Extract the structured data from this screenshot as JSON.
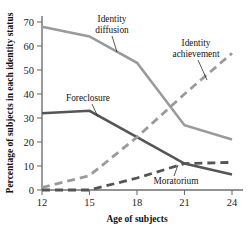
{
  "chart_data": {
    "type": "line",
    "title": "",
    "xlabel": "Age of subjects",
    "ylabel": "Percentage of subjects in each identity status",
    "x": [
      12,
      15,
      18,
      21,
      24
    ],
    "xlim": [
      12,
      24
    ],
    "ylim": [
      0,
      70
    ],
    "xticks": [
      "12",
      "15",
      "18",
      "21",
      "24"
    ],
    "yticks": [
      "0",
      "10",
      "20",
      "30",
      "40",
      "50",
      "60",
      "70"
    ],
    "grid": false,
    "legend_position": "inline-annotations",
    "series": [
      {
        "name": "Identity diffusion",
        "values": [
          68,
          64,
          53,
          27,
          21
        ],
        "color": "#9a9a9a",
        "style": "solid",
        "width": 2.6,
        "label_x": 112,
        "label_y": 22,
        "label_line2_y": 33,
        "label_anchor": "middle",
        "leader": "M112,36 L117,52"
      },
      {
        "name": "Foreclosure",
        "values": [
          32,
          33,
          22,
          11,
          6.5
        ],
        "color": "#555555",
        "style": "solid",
        "width": 2.6,
        "label_x": 88,
        "label_y": 101,
        "label_line2_y": 0,
        "label_anchor": "middle",
        "leader": "M92,104 L98,117"
      },
      {
        "name": "Identity achievement",
        "values": [
          1,
          6,
          22,
          40,
          57
        ],
        "color": "#9a9a9a",
        "style": "dashed",
        "width": 2.8,
        "label_x": 196,
        "label_y": 46,
        "label_line2_y": 57,
        "label_anchor": "middle",
        "leader": "M198,60 L207,80"
      },
      {
        "name": "Moratorium",
        "values": [
          0,
          0,
          5,
          11,
          11.5
        ],
        "color": "#555555",
        "style": "dashed",
        "width": 2.8,
        "label_x": 176,
        "label_y": 184,
        "label_line2_y": 0,
        "label_anchor": "middle",
        "leader": "M174,176 L178,165"
      }
    ],
    "annotations": [
      {
        "text": "Identity",
        "line2": "diffusion"
      },
      {
        "text": "Foreclosure",
        "line2": ""
      },
      {
        "text": "Identity",
        "line2": "achievement"
      },
      {
        "text": "Moratorium",
        "line2": ""
      }
    ]
  },
  "axes": {
    "x_title": "Age of subjects",
    "y_title": "Percentage of subjects in each identity status",
    "x_tick_labels": [
      "12",
      "15",
      "18",
      "21",
      "24"
    ],
    "y_tick_labels": [
      "70",
      "60",
      "50",
      "40",
      "30",
      "20",
      "10",
      "0"
    ]
  },
  "labels": {
    "identity_diffusion_l1": "Identity",
    "identity_diffusion_l2": "diffusion",
    "foreclosure": "Foreclosure",
    "identity_achievement_l1": "Identity",
    "identity_achievement_l2": "achievement",
    "moratorium": "Moratorium"
  },
  "colors": {
    "light_series": "#9a9a9a",
    "dark_series": "#555555",
    "axis": "#6f6f6f",
    "text": "#1a1a1a",
    "background": "#ffffff"
  }
}
